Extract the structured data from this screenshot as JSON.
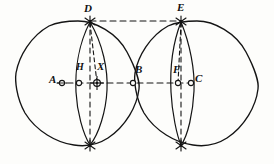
{
  "figure": {
    "background_color": "#fdfdfb",
    "ink_color": "#141414",
    "canvas": {
      "width": 274,
      "height": 164
    }
  },
  "labels": {
    "A": "A",
    "B": "B",
    "C": "C",
    "D": "D",
    "E": "E",
    "F": "F",
    "H": "H",
    "X": "X"
  },
  "points": [
    {
      "name": "A",
      "label": "A",
      "x": 62,
      "y": 83,
      "marker": "open-circle",
      "label_dx": -11,
      "label_dy": -5
    },
    {
      "name": "H",
      "label": "H",
      "x": 79,
      "y": 83,
      "marker": "open-circle",
      "label_dx": -2,
      "label_dy": -16
    },
    {
      "name": "X",
      "label": "X",
      "x": 97,
      "y": 83,
      "marker": "crosshair",
      "label_dx": 2,
      "label_dy": -17
    },
    {
      "name": "B",
      "label": "B",
      "x": 133,
      "y": 83,
      "marker": "open-circle",
      "label_dx": 3,
      "label_dy": -14
    },
    {
      "name": "F",
      "label": "F",
      "x": 178,
      "y": 83,
      "marker": "open-circle",
      "label_dx": -2,
      "label_dy": -14
    },
    {
      "name": "C",
      "label": "C",
      "x": 192,
      "y": 83,
      "marker": "open-circle",
      "label_dx": 6,
      "label_dy": -5
    },
    {
      "name": "D",
      "label": "D",
      "x": 90,
      "y": 21,
      "marker": "star",
      "label_dx": -4,
      "label_dy": -15
    },
    {
      "name": "E",
      "label": "E",
      "x": 181,
      "y": 21,
      "marker": "star",
      "label_dx": -2,
      "label_dy": -16
    },
    {
      "name": "D-bottom",
      "label": "",
      "x": 90,
      "y": 146,
      "marker": "star",
      "label_dx": 0,
      "label_dy": 0
    },
    {
      "name": "E-bottom",
      "label": "",
      "x": 181,
      "y": 146,
      "marker": "star",
      "label_dx": 0,
      "label_dy": 0
    }
  ],
  "circles": [
    {
      "name": "left-circle",
      "cx": 78,
      "cy": 83,
      "r": 62
    },
    {
      "name": "right-circle",
      "cx": 197,
      "cy": 83,
      "r": 62
    }
  ],
  "chords": [
    {
      "name": "left-vertical-chord",
      "x": 90,
      "y1": 21,
      "y2": 146,
      "style": "dashed"
    },
    {
      "name": "right-vertical-chord",
      "x": 181,
      "y1": 21,
      "y2": 146,
      "style": "dashed"
    }
  ],
  "arcs": [
    {
      "name": "left-lens-arc",
      "from": "D",
      "to": "D-bottom",
      "bulge": "right",
      "style": "solid"
    },
    {
      "name": "right-lens-arc",
      "from": "E",
      "to": "E-bottom",
      "bulge": "right",
      "style": "solid"
    }
  ],
  "guide_lines": [
    {
      "name": "horizontal-axis-line",
      "x1": 58,
      "y1": 83,
      "x2": 196,
      "y2": 83,
      "style": "dashed"
    },
    {
      "name": "top-connector-D-to-E",
      "x1": 90,
      "y1": 21,
      "x2": 181,
      "y2": 21,
      "style": "dashed"
    },
    {
      "name": "radius-D-to-X",
      "x1": 90,
      "y1": 22,
      "x2": 97,
      "y2": 83,
      "style": "dashed"
    },
    {
      "name": "radius-E-to-F",
      "x1": 181,
      "y1": 22,
      "x2": 178,
      "y2": 83,
      "style": "dashed"
    }
  ]
}
